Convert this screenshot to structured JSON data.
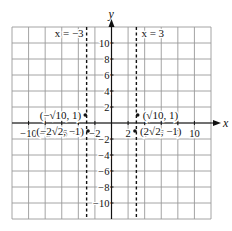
{
  "chart_data": {
    "type": "scatter",
    "title": "",
    "xlabel": "x",
    "ylabel": "y",
    "xlim": [
      -12,
      12
    ],
    "ylim": [
      -12,
      12
    ],
    "grid": true,
    "grid_step": 2,
    "x_ticks": [
      -10,
      -8,
      -6,
      -4,
      -2,
      2,
      4,
      6,
      8,
      10
    ],
    "y_ticks": [
      -10,
      -8,
      -6,
      -4,
      -2,
      2,
      4,
      6,
      8,
      10
    ],
    "asymptotes": [
      {
        "type": "vertical",
        "x": -3,
        "label": "x = −3",
        "style": "dashed"
      },
      {
        "type": "vertical",
        "x": 3,
        "label": "x = 3",
        "style": "dashed"
      }
    ],
    "points": [
      {
        "x": -3.162,
        "y": 1,
        "label": "(−√10, 1)"
      },
      {
        "x": 3.162,
        "y": 1,
        "label": "(√10, 1)"
      },
      {
        "x": -2.828,
        "y": -1,
        "label": "(−2√2, −1)"
      },
      {
        "x": 2.828,
        "y": -1,
        "label": "(2√2, −1)"
      }
    ]
  },
  "colors": {
    "grid": "#9a9a9a",
    "axis": "#111111",
    "point": "#111111"
  }
}
